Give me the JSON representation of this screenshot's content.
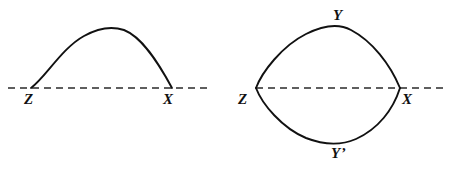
{
  "figure": {
    "background_color": "#ffffff",
    "stroke_color": "#111111",
    "dash_color": "#2a2a2a",
    "width": 451,
    "height": 170,
    "panels": [
      {
        "name": "left-panel",
        "description": "Single arc from Z rising to an apex and returning down to X on a dashed horizontal axis",
        "axis": {
          "y": 88,
          "x_start": 8,
          "x_end": 208
        },
        "arc_path": "M 31 88 C 45 78 62 48 84 36 C 100 27 112 26 124 30 C 142 37 158 62 172 88",
        "labels": [
          {
            "name": "label-z",
            "text": "Z",
            "x": 24,
            "y": 92
          },
          {
            "name": "label-x",
            "text": "X",
            "x": 163,
            "y": 92
          }
        ]
      },
      {
        "name": "right-panel",
        "description": "Lens shape: two arcs between Z and X meeting at apex Y above and Y-prime below the dashed axis",
        "axis": {
          "y": 88,
          "x_start": 256,
          "x_end": 446
        },
        "arc_upper_path": "M 256 88 C 262 72 282 46 306 34 C 324 25 340 24 351 30 C 372 41 390 64 400 88",
        "arc_lower_path": "M 256 88 C 262 104 282 128 306 138 C 324 145 342 145 356 139 C 378 129 393 110 400 88",
        "labels": [
          {
            "name": "label-z",
            "text": "Z",
            "x": 238,
            "y": 92
          },
          {
            "name": "label-x",
            "text": "X",
            "x": 402,
            "y": 92
          },
          {
            "name": "label-y",
            "text": "Y",
            "x": 333,
            "y": 8
          },
          {
            "name": "label-y-prime",
            "text": "Y’",
            "x": 331,
            "y": 146
          }
        ]
      }
    ]
  }
}
